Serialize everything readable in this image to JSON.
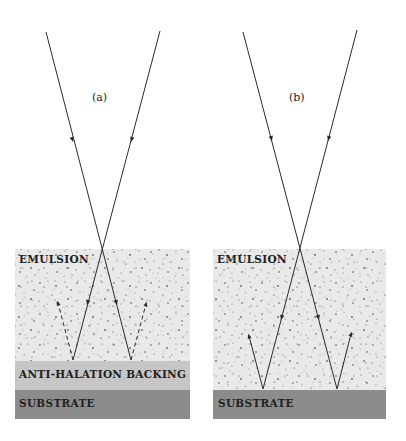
{
  "figure": {
    "colors": {
      "background": "#ffffff",
      "emulsion": "#e9e9e9",
      "emulsion_grain": "#333333",
      "anti_halation_backing": "#c6c6c6",
      "substrate": "#8c8c8c",
      "ray": "#2a2a2a"
    },
    "panels": [
      {
        "id": "a",
        "label": "(a)",
        "layers": {
          "emulsion": "EMULSION",
          "backing": "ANTI-HALATION BACKING",
          "substrate": "SUBSTRATE"
        },
        "reflected_rays_style": "dashed"
      },
      {
        "id": "b",
        "label": "(b)",
        "layers": {
          "emulsion": "EMULSION",
          "substrate": "SUBSTRATE"
        },
        "reflected_rays_style": "solid"
      }
    ]
  }
}
